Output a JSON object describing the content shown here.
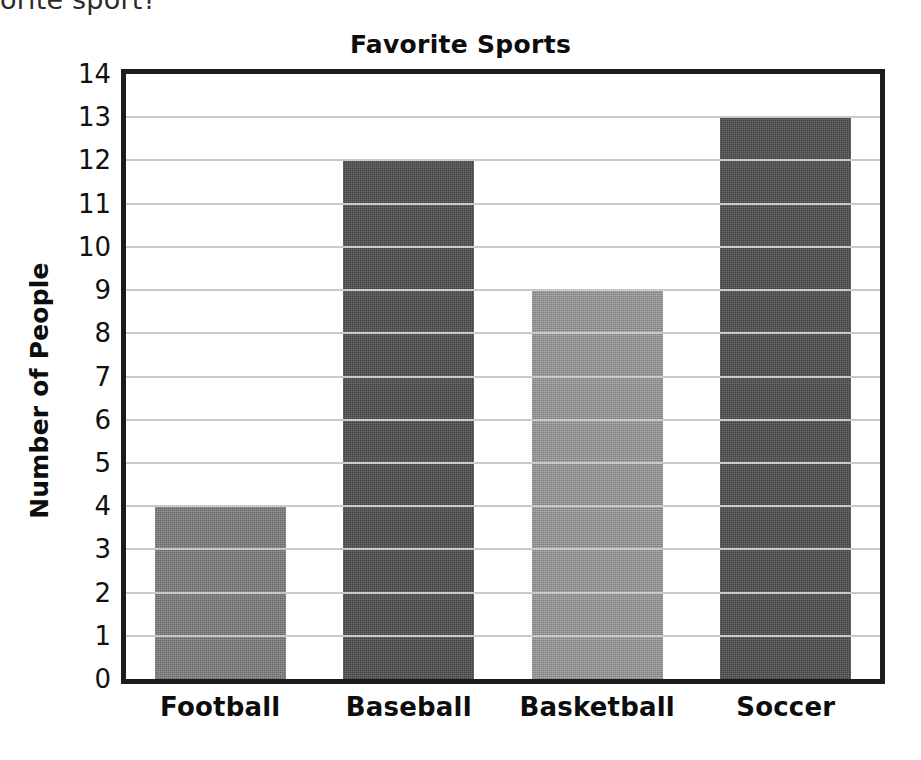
{
  "page": {
    "clipped_question_fragment": "orite sport?"
  },
  "chart_data": {
    "type": "bar",
    "title": "Favorite Sports",
    "xlabel": "",
    "ylabel": "Number of People",
    "categories": [
      "Football",
      "Baseball",
      "Basketball",
      "Soccer"
    ],
    "values": [
      4,
      12,
      9,
      13
    ],
    "ylim": [
      0,
      14
    ],
    "ytick_labels": [
      "14",
      "13",
      "12",
      "11",
      "10",
      "9",
      "8",
      "7",
      "6",
      "5",
      "4",
      "3",
      "2",
      "1",
      "0"
    ],
    "ytick_values": [
      14,
      13,
      12,
      11,
      10,
      9,
      8,
      7,
      6,
      5,
      4,
      3,
      2,
      1,
      0
    ],
    "grid": true,
    "legend": false,
    "bar_colors": [
      "#818181",
      "#555555",
      "#9a9a9a",
      "#555555"
    ],
    "frame_color": "#1c1c1c",
    "gridline_color": "#c9c9c9",
    "series": [
      {
        "name": "Number of People",
        "values": [
          4,
          12,
          9,
          13
        ]
      }
    ]
  }
}
